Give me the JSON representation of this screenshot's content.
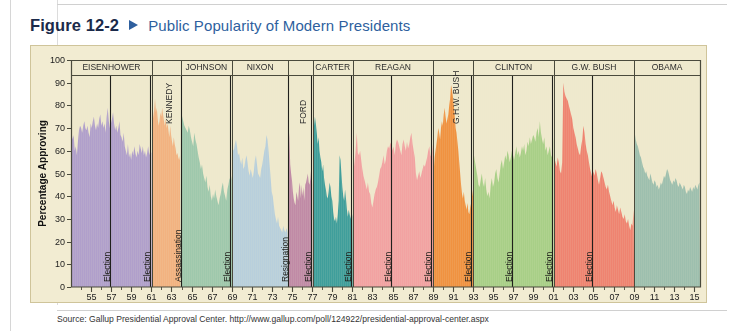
{
  "figure": {
    "number": "Figure 12-2",
    "marker_icon": "triangle-right-icon",
    "title": "Public Popularity of Modern Presidents",
    "number_color": "#1b2a4a",
    "title_color": "#2e5f9e"
  },
  "source": {
    "text": "Source: Gallup Presidential Approval Center. http://www.gallup.com/poll/124922/presidential-approval-center.aspx"
  },
  "panel": {
    "background": "#f2ecd2",
    "border_color": "#cfc49a",
    "plot_background": "#efe9cd",
    "axis_color": "#4a4a3c"
  },
  "chart_data": {
    "type": "area",
    "title": "Public Popularity of Modern Presidents",
    "xlabel": "Year",
    "ylabel": "Percentage Approving",
    "ylim": [
      0,
      100
    ],
    "ytick_step": 10,
    "yticks": [
      0,
      10,
      20,
      30,
      40,
      50,
      60,
      70,
      80,
      90,
      100
    ],
    "xlim": [
      1953.0,
      2015.6
    ],
    "xticks": [
      {
        "value": 1955,
        "label": "55"
      },
      {
        "value": 1957,
        "label": "57"
      },
      {
        "value": 1959,
        "label": "59"
      },
      {
        "value": 1961,
        "label": "61"
      },
      {
        "value": 1963,
        "label": "63"
      },
      {
        "value": 1965,
        "label": "65"
      },
      {
        "value": 1967,
        "label": "67"
      },
      {
        "value": 1969,
        "label": "69"
      },
      {
        "value": 1971,
        "label": "71"
      },
      {
        "value": 1973,
        "label": "73"
      },
      {
        "value": 1975,
        "label": "75"
      },
      {
        "value": 1977,
        "label": "77"
      },
      {
        "value": 1979,
        "label": "79"
      },
      {
        "value": 1981,
        "label": "81"
      },
      {
        "value": 1983,
        "label": "83"
      },
      {
        "value": 1985,
        "label": "85"
      },
      {
        "value": 1987,
        "label": "87"
      },
      {
        "value": 1989,
        "label": "89"
      },
      {
        "value": 1991,
        "label": "91"
      },
      {
        "value": 1993,
        "label": "93"
      },
      {
        "value": 1995,
        "label": "95"
      },
      {
        "value": 1997,
        "label": "97"
      },
      {
        "value": 1999,
        "label": "99"
      },
      {
        "value": 2001,
        "label": "01"
      },
      {
        "value": 2003,
        "label": "03"
      },
      {
        "value": 2005,
        "label": "05"
      },
      {
        "value": 2007,
        "label": "07"
      },
      {
        "value": 2009,
        "label": "09"
      },
      {
        "value": 2011,
        "label": "11"
      },
      {
        "value": 2013,
        "label": "13"
      },
      {
        "value": 2015,
        "label": "15"
      }
    ],
    "minor_tick_step": 1,
    "grid": false,
    "legend": "none",
    "series": [
      {
        "name": "EISENHOWER",
        "label": "EISENHOWER",
        "label_orientation": "horizontal",
        "color": "#b09fcb",
        "start": 1953.0,
        "end": 1961.05,
        "values": [
          68,
          65,
          67,
          60,
          62,
          58,
          64,
          69,
          71,
          70,
          68,
          71,
          73,
          70,
          69,
          71,
          68,
          66,
          72,
          70,
          73,
          75,
          71,
          69,
          72,
          70,
          74,
          76,
          71,
          73,
          70,
          72,
          68,
          75,
          79,
          73,
          70,
          72,
          74,
          77,
          72,
          69,
          71,
          68,
          70,
          73,
          67,
          66,
          64,
          68,
          62,
          60,
          58,
          63,
          57,
          59,
          56,
          60,
          58,
          62,
          59,
          57,
          60,
          58,
          63,
          61,
          59,
          62,
          58,
          60,
          57,
          59,
          62,
          58,
          60,
          59
        ]
      },
      {
        "name": "KENNEDY",
        "label": "KENNEDY",
        "label_orientation": "vertical",
        "color": "#f2b280",
        "start": 1961.05,
        "end": 1963.9,
        "values": [
          72,
          75,
          78,
          83,
          77,
          79,
          74,
          71,
          73,
          77,
          75,
          79,
          76,
          73,
          71,
          74,
          70,
          72,
          69,
          66,
          71,
          67,
          64,
          62,
          66,
          63,
          61,
          58,
          59,
          57,
          56,
          58
        ]
      },
      {
        "name": "JOHNSON",
        "label": "JOHNSON",
        "label_orientation": "horizontal",
        "color": "#9ec8ac",
        "start": 1963.9,
        "end": 1969.05,
        "values": [
          78,
          75,
          73,
          71,
          70,
          69,
          68,
          71,
          69,
          66,
          64,
          62,
          68,
          65,
          63,
          60,
          57,
          55,
          52,
          54,
          50,
          48,
          46,
          49,
          44,
          42,
          45,
          40,
          38,
          41,
          39,
          43,
          40,
          38,
          36,
          39,
          41,
          44,
          46,
          42,
          40,
          38,
          43,
          45,
          48,
          46,
          49
        ]
      },
      {
        "name": "NIXON",
        "label": "NIXON",
        "label_orientation": "horizontal",
        "color": "#b8cfdc",
        "start": 1969.05,
        "end": 1974.6,
        "values": [
          61,
          60,
          63,
          65,
          62,
          58,
          59,
          56,
          54,
          57,
          52,
          53,
          56,
          58,
          55,
          51,
          49,
          52,
          50,
          48,
          51,
          56,
          58,
          54,
          50,
          49,
          48,
          52,
          54,
          57,
          60,
          62,
          67,
          65,
          60,
          54,
          48,
          42,
          40,
          36,
          32,
          30,
          28,
          31,
          27,
          26,
          25,
          24,
          27,
          25,
          24,
          26,
          24
        ]
      },
      {
        "name": "FORD",
        "label": "FORD",
        "label_orientation": "vertical",
        "color": "#c08aa6",
        "start": 1974.6,
        "end": 1977.05,
        "values": [
          71,
          66,
          54,
          50,
          47,
          42,
          39,
          37,
          36,
          42,
          40,
          38,
          44,
          46,
          39,
          45,
          40,
          44,
          38,
          45,
          46,
          48,
          50,
          46,
          45,
          48,
          53,
          45
        ]
      },
      {
        "name": "CARTER",
        "label": "CARTER",
        "label_orientation": "horizontal",
        "color": "#3f9e9b",
        "start": 1977.05,
        "end": 1981.05,
        "values": [
          66,
          71,
          75,
          72,
          68,
          63,
          66,
          60,
          57,
          55,
          51,
          54,
          48,
          45,
          43,
          40,
          39,
          42,
          46,
          44,
          40,
          38,
          33,
          30,
          29,
          31,
          28,
          32,
          38,
          58,
          56,
          50,
          44,
          40,
          38,
          43,
          39,
          34,
          31,
          34,
          32,
          30,
          34,
          31
        ]
      },
      {
        "name": "REAGAN",
        "label": "REAGAN",
        "label_orientation": "horizontal",
        "color": "#f2a2a2",
        "start": 1981.05,
        "end": 1989.05,
        "values": [
          51,
          55,
          60,
          68,
          59,
          58,
          60,
          56,
          52,
          49,
          47,
          45,
          43,
          46,
          42,
          41,
          37,
          35,
          38,
          41,
          43,
          44,
          46,
          49,
          52,
          53,
          55,
          58,
          54,
          56,
          60,
          62,
          61,
          63,
          64,
          60,
          62,
          58,
          63,
          65,
          64,
          62,
          60,
          58,
          63,
          65,
          62,
          60,
          64,
          61,
          63,
          66,
          68,
          63,
          60,
          57,
          50,
          47,
          49,
          51,
          48,
          50,
          52,
          54,
          53,
          55,
          57,
          60,
          62,
          58,
          57,
          63
        ]
      },
      {
        "name": "G.H.W. BUSH",
        "label": "G.H.W. BUSH",
        "label_orientation": "vertical",
        "color": "#f09240",
        "start": 1989.05,
        "end": 1993.05,
        "values": [
          51,
          57,
          60,
          63,
          66,
          70,
          68,
          65,
          70,
          73,
          71,
          76,
          79,
          75,
          72,
          74,
          76,
          80,
          83,
          89,
          87,
          84,
          80,
          76,
          70,
          68,
          64,
          60,
          55,
          50,
          45,
          41,
          39,
          42,
          38,
          36,
          34,
          37,
          33,
          32,
          35,
          37,
          40,
          43
        ]
      },
      {
        "name": "CLINTON",
        "label": "CLINTON",
        "label_orientation": "horizontal",
        "color": "#a8cf87",
        "start": 1993.05,
        "end": 2001.05,
        "values": [
          58,
          55,
          52,
          49,
          45,
          44,
          47,
          50,
          46,
          44,
          48,
          43,
          40,
          42,
          39,
          45,
          48,
          44,
          46,
          50,
          52,
          48,
          46,
          50,
          54,
          56,
          52,
          55,
          58,
          56,
          60,
          58,
          55,
          57,
          60,
          58,
          56,
          59,
          62,
          58,
          60,
          57,
          59,
          62,
          60,
          63,
          58,
          60,
          64,
          62,
          66,
          63,
          65,
          67,
          66,
          64,
          68,
          70,
          66,
          73,
          68,
          65,
          63,
          66,
          60,
          62,
          58,
          60,
          62,
          58,
          57,
          66
        ]
      },
      {
        "name": "G.W. BUSH",
        "label": "G.W. BUSH",
        "label_orientation": "horizontal",
        "color": "#ef8370",
        "start": 2001.05,
        "end": 2009.05,
        "values": [
          57,
          55,
          53,
          57,
          55,
          51,
          50,
          55,
          90,
          86,
          84,
          83,
          82,
          80,
          78,
          76,
          74,
          70,
          68,
          66,
          63,
          61,
          59,
          58,
          62,
          65,
          71,
          68,
          63,
          60,
          58,
          55,
          52,
          50,
          48,
          51,
          49,
          52,
          50,
          47,
          45,
          48,
          51,
          50,
          48,
          46,
          44,
          43,
          45,
          42,
          40,
          38,
          36,
          38,
          35,
          33,
          36,
          34,
          32,
          35,
          33,
          31,
          30,
          32,
          29,
          28,
          30,
          27,
          25,
          28,
          27,
          34
        ]
      },
      {
        "name": "OBAMA",
        "label": "OBAMA",
        "label_orientation": "horizontal",
        "color": "#9dbfae",
        "start": 2009.05,
        "end": 2015.6,
        "values": [
          68,
          65,
          63,
          62,
          60,
          58,
          57,
          55,
          53,
          52,
          50,
          51,
          49,
          48,
          47,
          50,
          48,
          46,
          45,
          47,
          46,
          44,
          45,
          43,
          44,
          46,
          45,
          47,
          49,
          48,
          50,
          52,
          51,
          49,
          47,
          46,
          45,
          47,
          46,
          48,
          47,
          45,
          44,
          46,
          45,
          44,
          43,
          45,
          44,
          42,
          41,
          43,
          42,
          44,
          43,
          42,
          44,
          43,
          45,
          44,
          43,
          45,
          46
        ]
      }
    ],
    "annotations": [
      {
        "label": "Election",
        "year": 1956.85,
        "type": "election-marker"
      },
      {
        "label": "Election",
        "year": 1960.85,
        "type": "election-marker"
      },
      {
        "label": "Assassination",
        "year": 1963.9,
        "type": "assassination-marker"
      },
      {
        "label": "Election",
        "year": 1968.85,
        "type": "election-marker"
      },
      {
        "label": "Resignation",
        "year": 1974.6,
        "type": "resignation-marker"
      },
      {
        "label": "Election",
        "year": 1976.85,
        "type": "election-marker"
      },
      {
        "label": "Election",
        "year": 1980.85,
        "type": "election-marker"
      },
      {
        "label": "Election",
        "year": 1984.85,
        "type": "election-marker"
      },
      {
        "label": "Election",
        "year": 1988.85,
        "type": "election-marker"
      },
      {
        "label": "Election",
        "year": 1992.85,
        "type": "election-marker"
      },
      {
        "label": "Election",
        "year": 1996.85,
        "type": "election-marker"
      },
      {
        "label": "Election",
        "year": 2000.85,
        "type": "election-marker"
      },
      {
        "label": "Election",
        "year": 2004.85,
        "type": "election-marker"
      }
    ]
  }
}
